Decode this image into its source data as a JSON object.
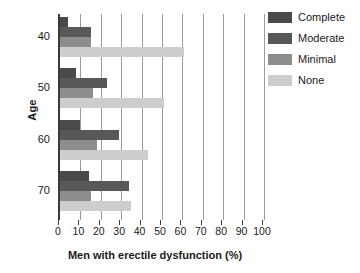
{
  "chart_data": {
    "type": "bar",
    "orientation": "horizontal",
    "title": "",
    "xlabel": "Men with erectile dysfunction (%)",
    "ylabel": "Age",
    "categories": [
      "40",
      "50",
      "60",
      "70"
    ],
    "xlim": [
      0,
      100
    ],
    "xticks": [
      0,
      10,
      20,
      30,
      40,
      50,
      60,
      70,
      80,
      90,
      100
    ],
    "grid": true,
    "legend_position": "right",
    "series": [
      {
        "name": "Complete",
        "color": "#4a4a4a",
        "values": [
          4,
          8,
          10,
          14
        ]
      },
      {
        "name": "Moderate",
        "color": "#585858",
        "values": [
          15,
          23,
          29,
          34
        ]
      },
      {
        "name": "Minimal",
        "color": "#8d8d8d",
        "values": [
          15,
          16,
          18,
          15
        ]
      },
      {
        "name": "None",
        "color": "#cdcdcd",
        "values": [
          61,
          51,
          43,
          35
        ]
      }
    ]
  },
  "legend": {
    "items": [
      {
        "label": "Complete"
      },
      {
        "label": "Moderate"
      },
      {
        "label": "Minimal"
      },
      {
        "label": "None"
      }
    ]
  },
  "axes": {
    "y_title": "Age",
    "x_title": "Men with erectile dysfunction (%)",
    "y_tick_labels": [
      "40",
      "50",
      "60",
      "70"
    ],
    "x_tick_labels": [
      "0",
      "10",
      "20",
      "30",
      "40",
      "50",
      "60",
      "70",
      "80",
      "90",
      "100"
    ]
  }
}
